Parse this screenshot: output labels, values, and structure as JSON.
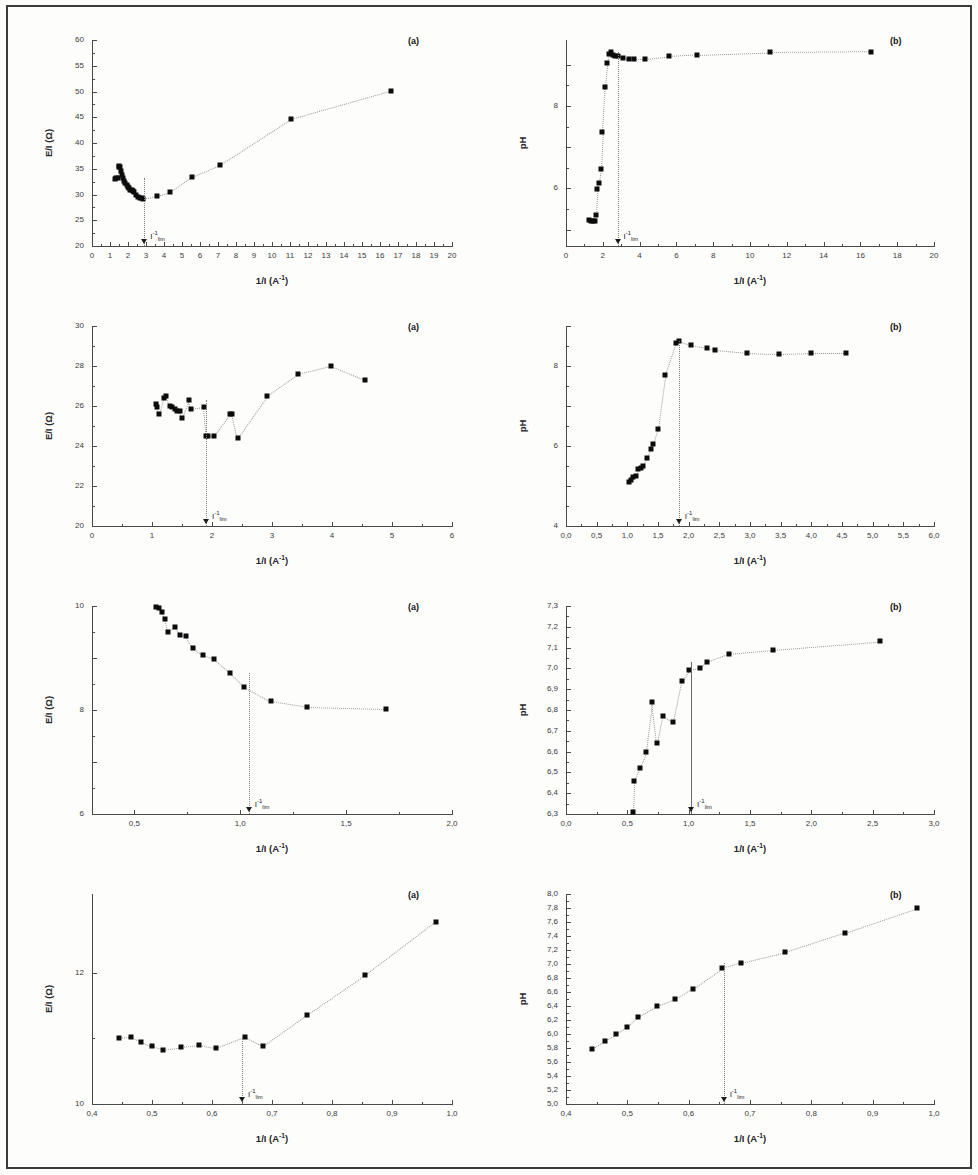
{
  "figure": {
    "axis_labels": {
      "x": "1/I (A⁻¹)",
      "y_resistance": "E/I (Ω)",
      "y_ph": "pH"
    },
    "lim_annotation": "I⁻¹lim",
    "marker_color": "#0c0c0c",
    "guide_color": "#9a9a9a",
    "axis_color": "#4a4a4a"
  },
  "chart_data": [
    {
      "id": "r1a",
      "type": "scatter",
      "panel_tag": "(a)",
      "title": "",
      "xlabel": "1/I (A⁻¹)",
      "ylabel": "E/I (Ω)",
      "xlim": [
        0,
        20
      ],
      "ylim": [
        20,
        60
      ],
      "xticks": [
        0,
        1,
        2,
        3,
        4,
        5,
        6,
        7,
        8,
        9,
        10,
        11,
        12,
        13,
        14,
        15,
        16,
        17,
        18,
        19,
        20
      ],
      "xticklabels": [
        "0",
        "1",
        "2",
        "3",
        "4",
        "5",
        "6",
        "7",
        "8",
        "9",
        "10",
        "11",
        "12",
        "13",
        "14",
        "15",
        "16",
        "17",
        "18",
        "19",
        "20"
      ],
      "yticks": [
        20,
        25,
        30,
        35,
        40,
        45,
        50,
        55,
        60
      ],
      "yticklabels": [
        "20",
        "25",
        "30",
        "35",
        "40",
        "45",
        "50",
        "55",
        "60"
      ],
      "grid": false,
      "annotation_x": 2.9,
      "x": [
        1.25,
        1.33,
        1.42,
        1.48,
        1.52,
        1.58,
        1.62,
        1.66,
        1.72,
        1.78,
        1.85,
        1.92,
        1.98,
        2.05,
        2.12,
        2.2,
        2.28,
        2.36,
        2.45,
        2.55,
        2.65,
        2.75,
        2.85,
        3.62,
        4.35,
        5.55,
        7.1,
        11.05,
        16.6
      ],
      "y": [
        33.1,
        33.3,
        33.2,
        35.3,
        35.6,
        35.4,
        34.6,
        33.8,
        33.2,
        32.6,
        32.2,
        31.8,
        31.4,
        31.2,
        30.9,
        30.8,
        30.6,
        30.4,
        30.0,
        29.6,
        29.4,
        29.3,
        29.2,
        29.8,
        30.5,
        33.4,
        35.7,
        44.6,
        50.1
      ]
    },
    {
      "id": "r1b",
      "type": "scatter",
      "panel_tag": "(b)",
      "title": "",
      "xlabel": "1/I (A⁻¹)",
      "ylabel": "pH",
      "xlim": [
        0,
        20
      ],
      "ylim": [
        4.6,
        9.6
      ],
      "xticks": [
        0,
        2,
        4,
        6,
        8,
        10,
        12,
        14,
        16,
        18,
        20
      ],
      "xticklabels": [
        "0",
        "2",
        "4",
        "6",
        "8",
        "10",
        "12",
        "14",
        "16",
        "18",
        "20"
      ],
      "yticks": [
        5,
        6,
        7,
        8,
        9
      ],
      "yticklabels": [
        "",
        "6",
        "",
        "8",
        ""
      ],
      "grid": false,
      "annotation_x": 2.8,
      "x": [
        1.25,
        1.35,
        1.45,
        1.55,
        1.62,
        1.7,
        1.78,
        1.88,
        1.98,
        2.12,
        2.25,
        2.35,
        2.45,
        2.55,
        2.68,
        2.85,
        3.1,
        3.45,
        3.7,
        4.3,
        5.6,
        7.1,
        11.1,
        16.6
      ],
      "y": [
        5.22,
        5.2,
        5.2,
        5.2,
        5.36,
        5.98,
        6.14,
        6.48,
        7.36,
        8.45,
        9.05,
        9.25,
        9.3,
        9.24,
        9.2,
        9.2,
        9.16,
        9.14,
        9.14,
        9.14,
        9.2,
        9.24,
        9.3,
        9.32
      ]
    },
    {
      "id": "r2a",
      "type": "scatter",
      "panel_tag": "(a)",
      "title": "",
      "xlabel": "1/I (A⁻¹)",
      "ylabel": "E/I (Ω)",
      "xlim": [
        0,
        6
      ],
      "ylim": [
        20,
        30
      ],
      "xticks": [
        0,
        1,
        2,
        3,
        4,
        5,
        6
      ],
      "xticklabels": [
        "0",
        "1",
        "2",
        "3",
        "4",
        "5",
        "6"
      ],
      "yticks": [
        20,
        22,
        24,
        26,
        28,
        30
      ],
      "yticklabels": [
        "20",
        "22",
        "24",
        "26",
        "28",
        "30"
      ],
      "grid": false,
      "annotation_x": 1.9,
      "x": [
        1.07,
        1.09,
        1.12,
        1.2,
        1.23,
        1.3,
        1.33,
        1.38,
        1.42,
        1.47,
        1.5,
        1.62,
        1.65,
        1.86,
        1.9,
        1.93,
        2.03,
        2.3,
        2.34,
        2.43,
        2.92,
        3.44,
        3.98,
        4.55
      ],
      "y": [
        26.1,
        25.95,
        25.6,
        26.4,
        26.5,
        26.0,
        25.95,
        25.85,
        25.75,
        25.75,
        25.4,
        26.3,
        25.85,
        25.95,
        24.5,
        24.5,
        24.5,
        25.6,
        25.6,
        24.4,
        26.5,
        27.6,
        28.0,
        27.3
      ]
    },
    {
      "id": "r2b",
      "type": "scatter",
      "panel_tag": "(b)",
      "title": "",
      "xlabel": "1/I (A⁻¹)",
      "ylabel": "pH",
      "xlim": [
        0,
        6
      ],
      "ylim": [
        4,
        9
      ],
      "xticks": [
        0,
        0.5,
        1,
        1.5,
        2,
        2.5,
        3,
        3.5,
        4,
        4.5,
        5,
        5.5,
        6
      ],
      "xticklabels": [
        "0,0",
        "0,5",
        "1,0",
        "1,5",
        "2,0",
        "2,5",
        "3,0",
        "3,5",
        "4,0",
        "4,5",
        "5,0",
        "5,5",
        "6,0"
      ],
      "yticks": [
        4,
        5,
        6,
        7,
        8,
        9
      ],
      "yticklabels": [
        "4",
        "",
        "6",
        "",
        "8",
        ""
      ],
      "grid": false,
      "annotation_x": 1.84,
      "x": [
        1.03,
        1.06,
        1.1,
        1.14,
        1.18,
        1.22,
        1.26,
        1.32,
        1.38,
        1.42,
        1.5,
        1.62,
        1.8,
        1.85,
        2.03,
        2.3,
        2.43,
        2.95,
        3.47,
        4.0,
        4.56
      ],
      "y": [
        5.1,
        5.15,
        5.22,
        5.25,
        5.42,
        5.46,
        5.5,
        5.7,
        5.93,
        6.05,
        6.43,
        7.77,
        8.58,
        8.62,
        8.52,
        8.44,
        8.4,
        8.33,
        8.3,
        8.32,
        8.32
      ]
    },
    {
      "id": "r3a",
      "type": "scatter",
      "panel_tag": "(a)",
      "title": "",
      "xlabel": "1/I (A⁻¹)",
      "ylabel": "E/I (Ω)",
      "xlim": [
        0.3,
        2.0
      ],
      "ylim": [
        6,
        10
      ],
      "xticks": [
        0.5,
        1.0,
        1.5,
        2.0
      ],
      "xticklabels": [
        "0,5",
        "1,0",
        "1,5",
        "2,0"
      ],
      "yticks": [
        6,
        7,
        8,
        9,
        10
      ],
      "yticklabels": [
        "6",
        "",
        "8",
        "",
        "10"
      ],
      "grid": false,
      "annotation_x": 1.04,
      "x": [
        0.6,
        0.615,
        0.63,
        0.645,
        0.66,
        0.69,
        0.715,
        0.745,
        0.775,
        0.825,
        0.875,
        0.95,
        1.02,
        1.145,
        1.315,
        1.69
      ],
      "y": [
        9.98,
        9.96,
        9.88,
        9.75,
        9.5,
        9.6,
        9.45,
        9.42,
        9.2,
        9.05,
        8.98,
        8.72,
        8.45,
        8.17,
        8.06,
        8.02
      ]
    },
    {
      "id": "r3b",
      "type": "scatter",
      "panel_tag": "(b)",
      "title": "",
      "xlabel": "1/I (A⁻¹)",
      "ylabel": "pH",
      "xlim": [
        0.0,
        3.0
      ],
      "ylim": [
        6.3,
        7.3
      ],
      "xticks": [
        0.0,
        0.5,
        1.0,
        1.5,
        2.0,
        2.5,
        3.0
      ],
      "xticklabels": [
        "0,0",
        "0,5",
        "1,0",
        "1,5",
        "2,0",
        "2,5",
        "3,0"
      ],
      "yticks": [
        6.3,
        6.4,
        6.5,
        6.6,
        6.7,
        6.8,
        6.9,
        7.0,
        7.1,
        7.2,
        7.3
      ],
      "yticklabels": [
        "6,3",
        "6,4",
        "6,5",
        "6,6",
        "6,7",
        "6,8",
        "6,9",
        "7,0",
        "7,1",
        "7,2",
        "7,3"
      ],
      "grid": false,
      "annotation_x": 1.02,
      "x": [
        0.545,
        0.555,
        0.6,
        0.655,
        0.705,
        0.745,
        0.79,
        0.875,
        0.945,
        1.005,
        1.095,
        1.15,
        1.325,
        1.69,
        2.56
      ],
      "y": [
        6.31,
        6.46,
        6.52,
        6.6,
        6.84,
        6.64,
        6.77,
        6.74,
        6.94,
        6.99,
        7.0,
        7.03,
        7.07,
        7.09,
        7.13
      ]
    },
    {
      "id": "r4a",
      "type": "scatter",
      "panel_tag": "(a)",
      "title": "",
      "xlabel": "1/I (A⁻¹)",
      "ylabel": "E/I (Ω)",
      "xlim": [
        0.4,
        1.0
      ],
      "ylim": [
        10,
        13.2
      ],
      "xticks": [
        0.4,
        0.5,
        0.6,
        0.7,
        0.8,
        0.9,
        1.0
      ],
      "xticklabels": [
        "0,4",
        "0,5",
        "0,6",
        "0,7",
        "0,8",
        "0,9",
        "1,0"
      ],
      "yticks": [
        10,
        12
      ],
      "yticklabels": [
        "10",
        "12"
      ],
      "grid": false,
      "annotation_x": 0.65,
      "x": [
        0.445,
        0.465,
        0.482,
        0.5,
        0.518,
        0.548,
        0.578,
        0.607,
        0.655,
        0.685,
        0.758,
        0.855,
        0.973
      ],
      "y": [
        11.0,
        11.02,
        10.95,
        10.88,
        10.83,
        10.87,
        10.9,
        10.85,
        11.02,
        10.88,
        11.35,
        11.96,
        12.78
      ]
    },
    {
      "id": "r4b",
      "type": "scatter",
      "panel_tag": "(b)",
      "title": "",
      "xlabel": "1/I (A⁻¹)",
      "ylabel": "pH",
      "xlim": [
        0.4,
        1.0
      ],
      "ylim": [
        5.0,
        8.0
      ],
      "xticks": [
        0.4,
        0.5,
        0.6,
        0.7,
        0.8,
        0.9,
        1.0
      ],
      "xticklabels": [
        "0,4",
        "0,5",
        "0,6",
        "0,7",
        "0,8",
        "0,9",
        "1,0"
      ],
      "yticks": [
        5.0,
        5.2,
        5.4,
        5.6,
        5.8,
        6.0,
        6.2,
        6.4,
        6.6,
        6.8,
        7.0,
        7.2,
        7.4,
        7.6,
        7.8,
        8.0
      ],
      "yticklabels": [
        "5,0",
        "5,2",
        "5,4",
        "5,6",
        "5,8",
        "6,0",
        "6,2",
        "6,4",
        "6,6",
        "6,8",
        "7,0",
        "7,2",
        "7,4",
        "7,6",
        "7,8",
        "8,0"
      ],
      "grid": false,
      "annotation_x": 0.657,
      "x": [
        0.443,
        0.463,
        0.482,
        0.5,
        0.518,
        0.548,
        0.578,
        0.607,
        0.655,
        0.685,
        0.757,
        0.855,
        0.972
      ],
      "y": [
        5.79,
        5.9,
        6.0,
        6.1,
        6.25,
        6.4,
        6.5,
        6.65,
        6.94,
        7.02,
        7.17,
        7.45,
        7.8
      ]
    }
  ]
}
